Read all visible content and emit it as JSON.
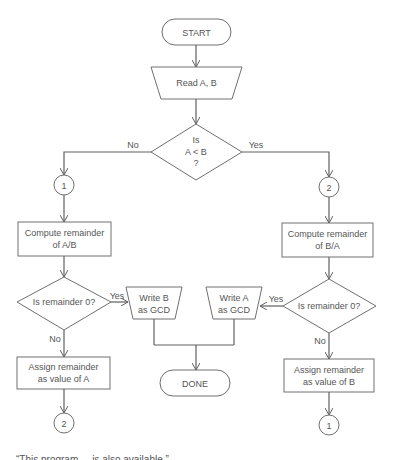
{
  "flowchart": {
    "start": "START",
    "read": "Read A, B",
    "decision_main": {
      "line1": "Is",
      "line2": "A < B",
      "line3": "?"
    },
    "branch_no": "No",
    "branch_yes": "Yes",
    "connector_left_top": "1",
    "connector_right_top": "2",
    "compute_left": {
      "line1": "Compute remainder",
      "line2": "of A/B"
    },
    "compute_right": {
      "line1": "Compute remainder",
      "line2": "of B/A"
    },
    "decision_left": "Is remainder 0?",
    "decision_right": "Is remainder 0?",
    "decision_left_yes": "Yes",
    "decision_left_no": "No",
    "decision_right_yes": "Yes",
    "decision_right_no": "No",
    "write_b": {
      "line1": "Write B",
      "line2": "as GCD"
    },
    "write_a": {
      "line1": "Write A",
      "line2": "as GCD"
    },
    "done": "DONE",
    "assign_left": {
      "line1": "Assign remainder",
      "line2": "as value of A"
    },
    "assign_right": {
      "line1": "Assign remainder",
      "line2": "as value of B"
    },
    "connector_left_bottom": "2",
    "connector_right_bottom": "1"
  },
  "caption": "“This program ... is also available.”"
}
